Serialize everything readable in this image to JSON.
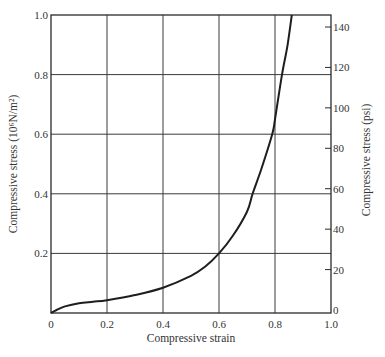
{
  "chart_data": {
    "type": "line",
    "title": "",
    "xlabel": "Compressive strain",
    "ylabel": "Compressive stress (10⁶N/m²)",
    "y2label": "Compressive stress (psi)",
    "xlim": [
      0,
      1.0
    ],
    "ylim": [
      0,
      1.0
    ],
    "y2lim": [
      0,
      145
    ],
    "grid": true,
    "legend": null,
    "x_ticks": [
      "0",
      "0.2",
      "0.4",
      "0.6",
      "0.8",
      "1.0"
    ],
    "y_ticks": [
      "0.2",
      "0.4",
      "0.6",
      "0.8",
      "1.0"
    ],
    "y2_ticks": [
      "0",
      "20",
      "40",
      "60",
      "80",
      "100",
      "120",
      "140"
    ],
    "series": [
      {
        "name": "stress-strain curve",
        "x": [
          0.0,
          0.02,
          0.05,
          0.1,
          0.15,
          0.2,
          0.3,
          0.4,
          0.5,
          0.55,
          0.6,
          0.65,
          0.7,
          0.72,
          0.75,
          0.79,
          0.8,
          0.825,
          0.845,
          0.86
        ],
        "y": [
          0.0,
          0.01,
          0.022,
          0.033,
          0.038,
          0.043,
          0.06,
          0.085,
          0.125,
          0.155,
          0.2,
          0.26,
          0.34,
          0.4,
          0.48,
          0.6,
          0.65,
          0.8,
          0.9,
          1.0
        ]
      }
    ]
  },
  "labels": {
    "x_axis": "Compressive strain",
    "y_axis_left": "Compressive stress (10⁶N/m²)",
    "y_axis_right": "Compressive stress (psi)"
  },
  "colors": {
    "line": "#1e1e1e",
    "grid": "#3a3a3a",
    "text": "#333333"
  }
}
